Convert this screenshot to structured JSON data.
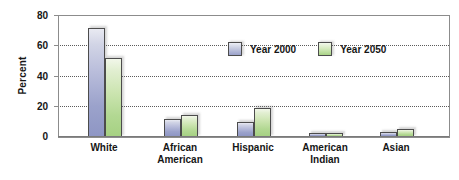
{
  "chart_data": {
    "type": "bar",
    "title": "",
    "xlabel": "",
    "ylabel": "Percent",
    "ylim": [
      0,
      80
    ],
    "yticks": [
      0,
      20,
      40,
      60,
      80
    ],
    "ytick_labels": [
      "0",
      "20",
      "40",
      "60",
      "80"
    ],
    "grid": true,
    "grid_axis": "y",
    "legend_position": "inside-upper-center",
    "categories": [
      "White",
      "African American",
      "Hispanic",
      "American Indian",
      "Asian"
    ],
    "category_lines": [
      [
        "White"
      ],
      [
        "African",
        "American"
      ],
      [
        "Hispanic"
      ],
      [
        "American",
        "Indian"
      ],
      [
        "Asian"
      ]
    ],
    "series": [
      {
        "name": "Year 2000",
        "color": "#9aa1ca",
        "values": [
          72,
          12,
          10,
          1,
          3
        ]
      },
      {
        "name": "Year 2050",
        "color": "#a9d387",
        "values": [
          52,
          14.5,
          19.5,
          1,
          5.5
        ]
      }
    ]
  },
  "legend": {
    "items": [
      {
        "label": "Year 2000",
        "swatch_class": "s2000"
      },
      {
        "label": "Year 2050",
        "swatch_class": "s2050"
      }
    ]
  },
  "axis": {
    "y_title": "Percent"
  }
}
